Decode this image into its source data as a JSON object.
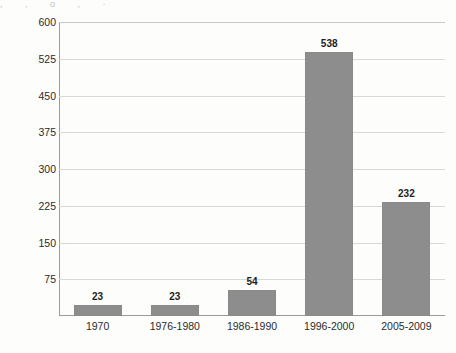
{
  "scan": {
    "top_fragment_text": ", ,   o  ,   ·"
  },
  "chart_data": {
    "type": "bar",
    "title": "",
    "xlabel": "",
    "ylabel": "Ratio of CEO to reporter salary",
    "categories": [
      "1970",
      "1976-1980",
      "1986-1990",
      "1996-2000",
      "2005-2009"
    ],
    "values": [
      23,
      23,
      54,
      538,
      232
    ],
    "value_labels": [
      "23",
      "23",
      "54",
      "538",
      "232"
    ],
    "ylim": [
      0,
      600
    ],
    "y_ticks": [
      75,
      150,
      225,
      300,
      375,
      450,
      525,
      600
    ],
    "y_tick_labels": [
      "75",
      "150",
      "225",
      "300",
      "375",
      "450",
      "525",
      "600"
    ],
    "grid": true,
    "legend": null,
    "bar_color": "#8d8d8d",
    "gridline_color": "#d8d8d8",
    "axis_color": "#9a9a9a",
    "background_color": "#fdfdfc"
  }
}
